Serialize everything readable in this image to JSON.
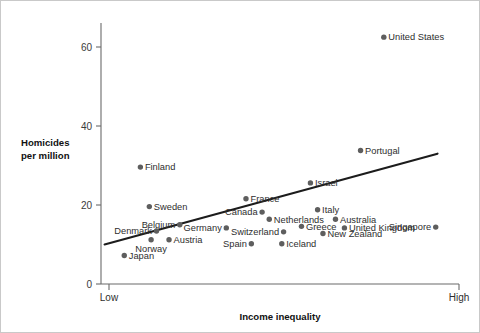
{
  "chart_data": {
    "type": "scatter",
    "title": "",
    "xlabel": "Income inequality",
    "ylabel": "Homicides per million",
    "ylabel_lines": [
      "Homicides",
      "per million"
    ],
    "x_tick_labels": [
      "Low",
      "High"
    ],
    "y_ticks": [
      0,
      20,
      40,
      60
    ],
    "y_tick_labels": [
      "0",
      "20",
      "40",
      "60"
    ],
    "ylim": [
      0,
      66
    ],
    "xlim": [
      0,
      100
    ],
    "grid": false,
    "legend": null,
    "trendline": {
      "label": "linear fit",
      "x0": 1.0,
      "y0": 10.0,
      "x1": 94.0,
      "y1": 33.0
    },
    "points": [
      {
        "name": "United States",
        "x": 79.0,
        "y": 62.5,
        "label_pos": "right"
      },
      {
        "name": "Portugal",
        "x": 72.5,
        "y": 33.8,
        "label_pos": "right"
      },
      {
        "name": "Finland",
        "x": 11.0,
        "y": 29.6,
        "label_pos": "right"
      },
      {
        "name": "Israel",
        "x": 58.5,
        "y": 25.6,
        "label_pos": "right"
      },
      {
        "name": "France",
        "x": 40.5,
        "y": 21.6,
        "label_pos": "right"
      },
      {
        "name": "Sweden",
        "x": 13.5,
        "y": 19.6,
        "label_pos": "right"
      },
      {
        "name": "Canada",
        "x": 45.0,
        "y": 18.2,
        "label_pos": "left"
      },
      {
        "name": "Italy",
        "x": 60.5,
        "y": 18.8,
        "label_pos": "right"
      },
      {
        "name": "Australia",
        "x": 65.5,
        "y": 16.4,
        "label_pos": "right"
      },
      {
        "name": "Netherlands",
        "x": 47.0,
        "y": 16.4,
        "label_pos": "right"
      },
      {
        "name": "Belgium",
        "x": 22.0,
        "y": 15.0,
        "label_pos": "left"
      },
      {
        "name": "Denmark",
        "x": 15.5,
        "y": 13.4,
        "label_pos": "left"
      },
      {
        "name": "United Kingdom",
        "x": 68.0,
        "y": 14.2,
        "label_pos": "right"
      },
      {
        "name": "Greece",
        "x": 56.0,
        "y": 14.6,
        "label_pos": "right"
      },
      {
        "name": "Germany",
        "x": 35.0,
        "y": 14.2,
        "label_pos": "left"
      },
      {
        "name": "Singapore",
        "x": 93.5,
        "y": 14.4,
        "label_pos": "left"
      },
      {
        "name": "Switzerland",
        "x": 51.0,
        "y": 13.2,
        "label_pos": "left"
      },
      {
        "name": "New Zealand",
        "x": 62.0,
        "y": 12.8,
        "label_pos": "right"
      },
      {
        "name": "Austria",
        "x": 19.0,
        "y": 11.2,
        "label_pos": "right"
      },
      {
        "name": "Iceland",
        "x": 50.5,
        "y": 10.2,
        "label_pos": "right"
      },
      {
        "name": "Spain",
        "x": 42.0,
        "y": 10.2,
        "label_pos": "left"
      },
      {
        "name": "Norway",
        "x": 14.0,
        "y": 11.2,
        "label_pos": "below"
      },
      {
        "name": "Japan",
        "x": 6.5,
        "y": 7.2,
        "label_pos": "right"
      }
    ],
    "colors": {
      "point": "#5e5e5e",
      "trendline": "#1c1c1c",
      "axis": "#6b6b6b",
      "text": "#2e2e2e",
      "background": "#ffffff",
      "border": "#c9c9c9"
    }
  }
}
